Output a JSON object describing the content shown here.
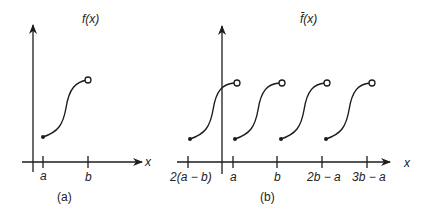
{
  "figure": {
    "panel_a": {
      "function_label": "f(x)",
      "x_axis_label": "x",
      "ticks": [
        "a",
        "b"
      ],
      "caption": "(a)"
    },
    "panel_b": {
      "function_label": "f̄(x)",
      "x_axis_label": "x",
      "ticks": [
        "2(a − b)",
        "a",
        "b",
        "2b − a",
        "3b − a"
      ],
      "caption": "(b)"
    }
  }
}
